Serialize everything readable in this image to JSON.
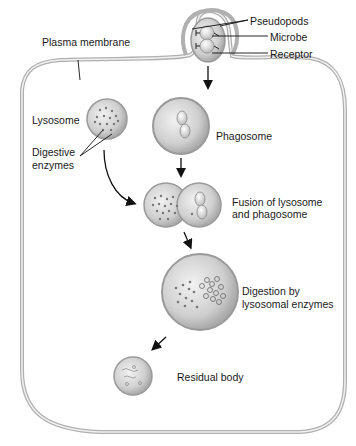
{
  "labels": {
    "pseudopods": "Pseudopods",
    "microbe": "Microbe",
    "receptor": "Receptor",
    "plasma_membrane": "Plasma membrane",
    "lysosome": "Lysosome",
    "digestive_enzymes_line1": "Digestive",
    "digestive_enzymes_line2": "enzymes",
    "phagosome": "Phagosome",
    "fusion_line1": "Fusion of lysosome",
    "fusion_line2": "and phagosome",
    "digestion_line1": "Digestion by",
    "digestion_line2": "lysosomal enzymes",
    "residual_body": "Residual body"
  },
  "colors": {
    "membrane": "#b5b5b5",
    "vesicle_fill": "#c9c9c9",
    "vesicle_edge": "#9a9a9a",
    "text": "#1a1a1a",
    "arrow": "#111111"
  }
}
